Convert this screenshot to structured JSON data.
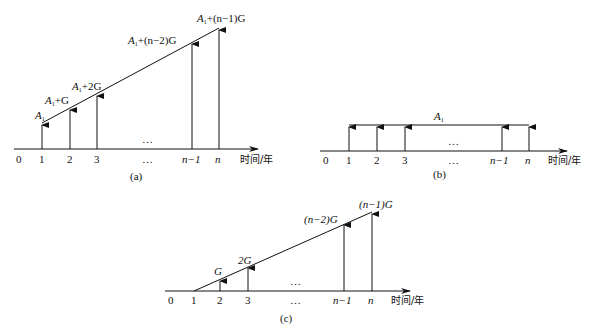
{
  "diagrams": {
    "a": {
      "caption": "(a)",
      "axis_label": "时间/年",
      "ticks": [
        "0",
        "1",
        "2",
        "3",
        "…",
        "n−1",
        "n"
      ],
      "cash_flows": [
        {
          "period": "1",
          "label_main": "A",
          "label_sub": "1",
          "label_rest": ""
        },
        {
          "period": "2",
          "label_main": "A",
          "label_sub": "1",
          "label_rest": "+G"
        },
        {
          "period": "3",
          "label_main": "A",
          "label_sub": "1",
          "label_rest": "+2G"
        },
        {
          "period": "n−1",
          "label_main": "A",
          "label_sub": "1",
          "label_rest": "+(n−2)G"
        },
        {
          "period": "n",
          "label_main": "A",
          "label_sub": "1",
          "label_rest": "+(n−1)G"
        }
      ],
      "mid_ellipsis": "…"
    },
    "b": {
      "caption": "(b)",
      "axis_label": "时间/年",
      "ticks": [
        "0",
        "1",
        "2",
        "3",
        "…",
        "n−1",
        "n"
      ],
      "uniform_label_main": "A",
      "uniform_label_sub": "1",
      "mid_ellipsis": "…"
    },
    "c": {
      "caption": "(c)",
      "axis_label": "时间/年",
      "ticks": [
        "0",
        "1",
        "2",
        "3",
        "…",
        "n−1",
        "n"
      ],
      "cash_flows": [
        {
          "period": "2",
          "label": "G"
        },
        {
          "period": "3",
          "label": "2G"
        },
        {
          "period": "n−1",
          "label": "(n−2)G"
        },
        {
          "period": "n",
          "label": "(n−1)G"
        }
      ],
      "mid_ellipsis": "…"
    }
  }
}
